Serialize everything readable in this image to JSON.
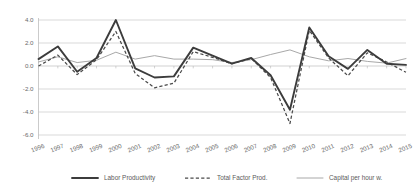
{
  "chart_data": {
    "type": "line",
    "title": "",
    "subtitle": "",
    "xlabel": "",
    "ylabel": "",
    "grid": true,
    "legend_position": "bottom",
    "categories": [
      "1996",
      "1997",
      "1998",
      "1999",
      "2000",
      "2001",
      "2002",
      "2003",
      "2004",
      "2005",
      "2006",
      "2007",
      "2008",
      "2009",
      "2010",
      "2011",
      "2012",
      "2013",
      "2014",
      "2015"
    ],
    "xlim": [
      "1996",
      "2015"
    ],
    "ylim": [
      -6.0,
      4.0
    ],
    "yticks": [
      "4.0",
      "2.0",
      "0.0",
      "-2.0",
      "-4.0",
      "-6.0"
    ],
    "ytick_values": [
      4.0,
      2.0,
      0.0,
      -2.0,
      -4.0,
      -6.0
    ],
    "series": [
      {
        "name": "Labor Productivity",
        "style": "solid-thick",
        "color": "#3c3c3c",
        "values": [
          0.6,
          1.7,
          -0.5,
          0.7,
          4.0,
          -0.2,
          -1.0,
          -0.9,
          1.6,
          0.9,
          0.2,
          0.7,
          -0.8,
          -3.8,
          3.35,
          0.85,
          -0.25,
          1.4,
          0.2,
          0.1
        ]
      },
      {
        "name": "Total Factor Prod.",
        "style": "dashed",
        "color": "#4a4a4a",
        "values": [
          0.0,
          0.95,
          -0.75,
          0.55,
          3.0,
          -0.65,
          -1.9,
          -1.5,
          1.25,
          0.75,
          0.2,
          0.65,
          -1.0,
          -5.0,
          3.1,
          0.7,
          -0.85,
          1.15,
          0.35,
          -0.55
        ]
      },
      {
        "name": "Capital per hour w.",
        "style": "solid-thin",
        "color": "#a8a8a8",
        "values": [
          0.35,
          0.8,
          0.3,
          0.5,
          1.2,
          0.6,
          0.9,
          0.6,
          0.6,
          0.55,
          0.3,
          0.55,
          1.0,
          1.4,
          0.8,
          0.45,
          0.65,
          0.4,
          0.25,
          0.65
        ]
      }
    ]
  },
  "legend": {
    "items": [
      {
        "label": "Labor Productivity"
      },
      {
        "label": "Total Factor Prod."
      },
      {
        "label": "Capital per hour w."
      }
    ]
  }
}
